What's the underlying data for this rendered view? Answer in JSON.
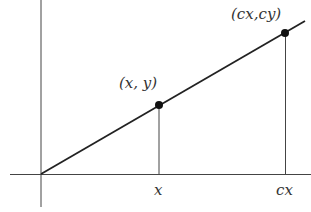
{
  "diagram": {
    "points": [
      {
        "label": "(x, y)",
        "x_tick": "x"
      },
      {
        "label": "(cx,cy)",
        "x_tick": "cx"
      }
    ],
    "colors": {
      "line": "#222222",
      "axes": "#444444",
      "background": "#ffffff"
    }
  }
}
